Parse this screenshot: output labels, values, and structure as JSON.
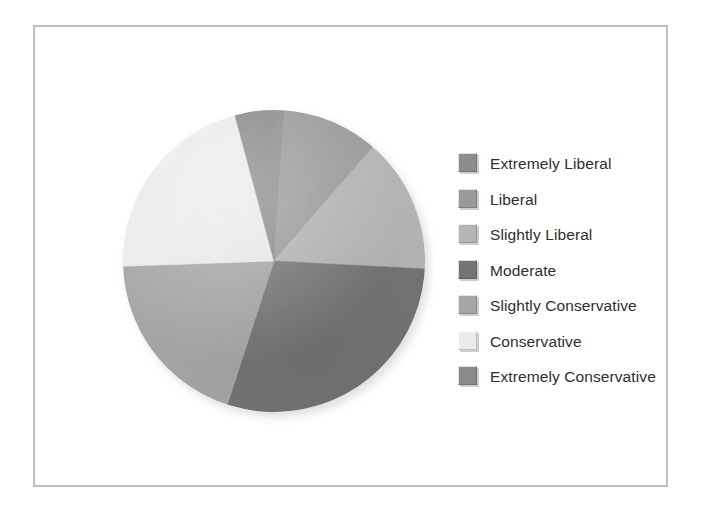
{
  "figure": {
    "frame_color": "#bcbfc2",
    "background": "#ffffff"
  },
  "legend": {
    "position": "right",
    "text_color": "#2e2e30",
    "items": [
      {
        "label": "Extremely Liberal",
        "color": "#8d8d8d"
      },
      {
        "label": "Liberal",
        "color": "#9a9a9a"
      },
      {
        "label": "Slightly Liberal",
        "color": "#b4b4b4"
      },
      {
        "label": "Moderate",
        "color": "#747474"
      },
      {
        "label": "Slightly Conservative",
        "color": "#a6a6a6"
      },
      {
        "label": "Conservative",
        "color": "#ebebeb"
      },
      {
        "label": "Extremely Conservative",
        "color": "#8a8a8a"
      }
    ]
  },
  "chart_data": {
    "type": "pie",
    "title": "",
    "subtitle": "",
    "xlabel": "",
    "ylabel": "",
    "grid": false,
    "legend_position": "right",
    "start_angle_deg": 0,
    "direction": "clockwise",
    "categories": [
      "Extremely Liberal",
      "Liberal",
      "Slightly Liberal",
      "Moderate",
      "Slightly Conservative",
      "Conservative",
      "Extremely Conservative"
    ],
    "values": [
      4,
      37,
      52,
      105,
      70,
      77,
      15
    ],
    "units": "degrees",
    "percentages": [
      1.1,
      10.3,
      14.4,
      29.2,
      19.4,
      21.4,
      4.2
    ],
    "colors": [
      "#8d8d8d",
      "#9a9a9a",
      "#b4b4b4",
      "#747474",
      "#a6a6a6",
      "#ebebeb",
      "#8a8a8a"
    ],
    "slices": [
      {
        "label": "Extremely Liberal",
        "percent": 1.1,
        "start_deg": 0,
        "end_deg": 4,
        "color": "#8d8d8d"
      },
      {
        "label": "Liberal",
        "percent": 10.3,
        "start_deg": 4,
        "end_deg": 41,
        "color": "#9a9a9a"
      },
      {
        "label": "Slightly Liberal",
        "percent": 14.4,
        "start_deg": 41,
        "end_deg": 93,
        "color": "#b4b4b4"
      },
      {
        "label": "Moderate",
        "percent": 29.2,
        "start_deg": 93,
        "end_deg": 198,
        "color": "#747474"
      },
      {
        "label": "Slightly Conservative",
        "percent": 19.4,
        "start_deg": 198,
        "end_deg": 268,
        "color": "#a6a6a6"
      },
      {
        "label": "Conservative",
        "percent": 21.4,
        "start_deg": 268,
        "end_deg": 345,
        "color": "#ebebeb"
      },
      {
        "label": "Extremely Conservative",
        "percent": 4.2,
        "start_deg": 345,
        "end_deg": 360,
        "color": "#8a8a8a"
      }
    ]
  }
}
